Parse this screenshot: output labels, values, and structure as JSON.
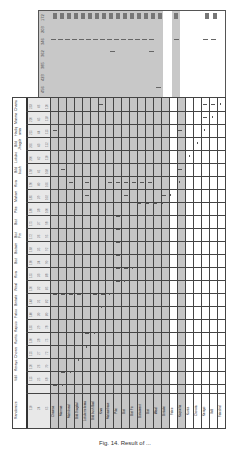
{
  "figure": {
    "caption": "Fig. 14. Result of ..."
  },
  "top_table": {
    "row_labels": [
      "172",
      "203",
      "346",
      "362",
      "385",
      "423",
      "456"
    ],
    "head_marks": 18
  },
  "main_table": {
    "row_labels": [
      "Chamsa",
      "Manmae",
      "Hadiq ama",
      "Bild Jhagdal",
      "Lokukorkora",
      "Bild bush",
      "Kiva",
      "Mahambase",
      "Pike",
      "Bist",
      "Bist Fin",
      "Bistaiment",
      "Bist",
      "Kiva",
      "Weal",
      "Bintake",
      "Fatoo",
      "Kapsiolia",
      "Kuntis",
      "Chowra",
      "Kerayo",
      "Vdil",
      "Randomize"
    ],
    "num_cols": [
      [
        "233",
        "220",
        "215",
        "205",
        "200",
        "198",
        "190",
        "185",
        "180",
        "175",
        "172",
        "168",
        "160",
        "155",
        "150",
        "148",
        "140",
        "135",
        "130",
        "125",
        "120",
        "115",
        "110"
      ],
      [
        "46",
        "45",
        "44",
        "43",
        "42",
        "41",
        "40",
        "39",
        "38",
        "37",
        "36",
        "35",
        "34",
        "33",
        "32",
        "31",
        "30",
        "29",
        "28",
        "27",
        "26",
        "25",
        "24"
      ],
      [
        "120",
        "118",
        "115",
        "112",
        "110",
        "108",
        "105",
        "102",
        "100",
        "98",
        "95",
        "92",
        "90",
        "88",
        "85",
        "82",
        "80",
        "78",
        "75",
        "72",
        "70",
        "68",
        "65"
      ]
    ],
    "col_labels": [
      "Chamsa",
      "Marrrae",
      "Matrilineal",
      "Bild Jhagdal",
      "Lotukorrokoma",
      "Bild bush Bad",
      "Kiva",
      "Mahambase",
      "Pike",
      "Bist",
      "Bist Fin",
      "Bistaiment",
      "Bist",
      "Weal",
      "Bintake",
      "Fatoo",
      "Kapsiolia",
      "Kuntis",
      "Chowra",
      "Kerayo",
      "Vdil",
      "Fatosbid",
      "Randomize"
    ]
  },
  "colors": {
    "shade": "#c6c6c6",
    "grid": "#444444",
    "mark": "#555555",
    "background": "#ffffff"
  }
}
